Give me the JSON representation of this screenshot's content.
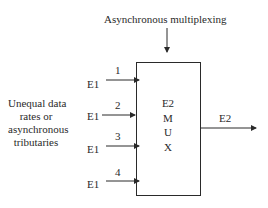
{
  "diagram": {
    "title": "Asynchronous multiplexing",
    "left_label": [
      "Unequal data",
      "rates or",
      "asynchronous",
      "tributaries"
    ],
    "inputs": [
      {
        "number": "1",
        "label": "E1"
      },
      {
        "number": "2",
        "label": "E1"
      },
      {
        "number": "3",
        "label": "E1"
      },
      {
        "number": "4",
        "label": "E1"
      }
    ],
    "mux_label": [
      "E2",
      "M",
      "U",
      "X"
    ],
    "output_label": "E2",
    "colors": {
      "line": "#2a2a2a",
      "background": "#ffffff"
    }
  }
}
